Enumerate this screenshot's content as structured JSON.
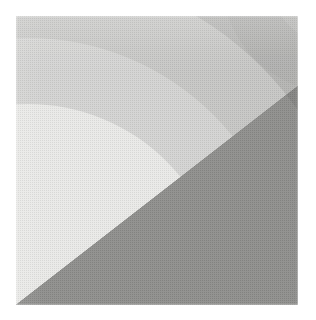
{
  "figure": {
    "title": "Grayscale concentric arc bands",
    "medium": "halftone print scan",
    "plate": {
      "x": 16,
      "y": 16,
      "width": 282,
      "height": 289,
      "background_color": "#ffffff"
    }
  },
  "chart_data": {
    "type": "pie",
    "title": "Grayscale concentric arc bands",
    "subtitle": "",
    "xlabel": "",
    "ylabel": "",
    "grid": false,
    "legend_position": "none",
    "arc_center": {
      "x": 28,
      "y": 300
    },
    "categories": [
      "innermost-bright-wedge",
      "light-band",
      "mid-light-band",
      "mid-band",
      "mid-dark-band",
      "dark-outer-region"
    ],
    "values": [
      1,
      2,
      3,
      4,
      5,
      6
    ],
    "bands": [
      {
        "name": "innermost-bright-wedge",
        "label": "Innermost bright wedge",
        "color": "#e9e9e7",
        "inner_radius": 0,
        "outer_radius": 196,
        "tone": "brightest"
      },
      {
        "name": "light-band",
        "label": "Light band",
        "color": "#d3d3d1",
        "inner_radius": 196,
        "outer_radius": 262,
        "tone": "light"
      },
      {
        "name": "mid-light-band",
        "label": "Mid-light band",
        "color": "#c6c6c4",
        "inner_radius": 262,
        "outer_radius": 330,
        "tone": "mid-light"
      },
      {
        "name": "mid-band",
        "label": "Mid band",
        "color": "#b4b4b2",
        "inner_radius": 330,
        "outer_radius": 404,
        "tone": "mid"
      },
      {
        "name": "mid-dark-band",
        "label": "Mid-dark band",
        "color": "#a5a5a3",
        "inner_radius": 404,
        "outer_radius": 470,
        "tone": "mid-dark"
      },
      {
        "name": "dark-outer-region",
        "label": "Dark outer region",
        "color": "#6f6f6d",
        "inner_radius": 470,
        "outer_radius": 900,
        "tone": "darkest"
      }
    ],
    "diagonal_edge": {
      "name": "straight-diagonal-edge",
      "label": "Straight diagonal edge",
      "from": {
        "x": 16,
        "y": 305
      },
      "to": {
        "x": 298,
        "y": 86
      },
      "lighter_side": "upper-left",
      "darker_side": "lower-right",
      "dark_color": "#6f6f6d"
    },
    "palette": [
      "#e9e9e7",
      "#d3d3d1",
      "#c6c6c4",
      "#b4b4b2",
      "#a5a5a3",
      "#8f8f8d",
      "#6f6f6d"
    ]
  }
}
